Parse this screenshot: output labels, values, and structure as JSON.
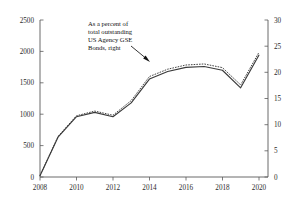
{
  "chart_data": {
    "type": "line",
    "title": "",
    "subtitle": "",
    "xlabel": "",
    "ylabel": "",
    "y2label": "",
    "grid": false,
    "legend_position": "none",
    "xlim": [
      2008,
      2020.5
    ],
    "ylim": [
      0,
      2500
    ],
    "y2lim": [
      0,
      30
    ],
    "x_ticks": [
      "2008",
      "2010",
      "2012",
      "2014",
      "2016",
      "2018",
      "2020"
    ],
    "x_tick_values": [
      2008,
      2010,
      2012,
      2014,
      2016,
      2018,
      2020
    ],
    "y_ticks": [
      "0",
      "500",
      "1000",
      "1500",
      "2000",
      "2500"
    ],
    "y_tick_values": [
      0,
      500,
      1000,
      1500,
      2000,
      2500
    ],
    "y2_ticks": [
      "0",
      "5",
      "10",
      "15",
      "20",
      "25",
      "30"
    ],
    "y2_tick_values": [
      0,
      5,
      10,
      15,
      20,
      25,
      30
    ],
    "x": [
      2008,
      2009,
      2010,
      2011,
      2012,
      2013,
      2014,
      2015,
      2016,
      2017,
      2018,
      2019,
      2020
    ],
    "series": [
      {
        "name": "Level, left",
        "axis": "left",
        "style": "solid",
        "values": [
          20,
          640,
          960,
          1030,
          960,
          1180,
          1560,
          1680,
          1745,
          1760,
          1700,
          1420,
          1940
        ]
      },
      {
        "name": "As a percent of total outstanding US Agency GSE Bonds, right",
        "axis": "right",
        "style": "dotted",
        "values": [
          0.3,
          7.8,
          11.7,
          12.6,
          11.8,
          14.6,
          19.2,
          20.6,
          21.4,
          21.6,
          20.9,
          17.6,
          23.8
        ]
      }
    ],
    "annotations": [
      {
        "name": "percent-series-callout",
        "lines": [
          "As a percent of",
          "total outstanding",
          "US Agency GSE",
          "Bonds, right"
        ],
        "target_x": 2013.9,
        "target_y2": 20.0
      }
    ]
  }
}
